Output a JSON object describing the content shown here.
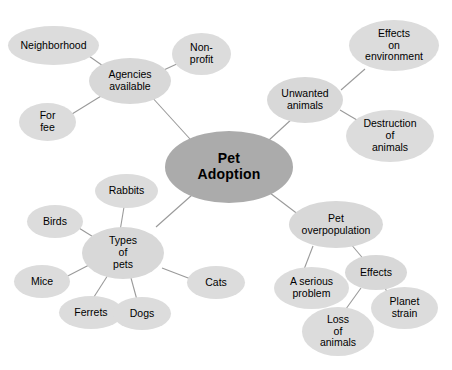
{
  "diagram": {
    "type": "mind-map",
    "title": "Pet Adoption",
    "background_color": "#ffffff",
    "central_node_color": "#ababab",
    "hub_node_color": "#d8d8d8",
    "leaf_node_color": "#dcdcdc",
    "edge_color": "#9a9a9a",
    "center": {
      "id": "pet-adoption",
      "label": "Pet\nAdoption"
    },
    "branches": [
      {
        "id": "agencies-available",
        "label": "Agencies\navailable",
        "children": [
          {
            "id": "neighborhood",
            "label": "Neighborhood"
          },
          {
            "id": "non-profit",
            "label": "Non-\nprofit"
          },
          {
            "id": "for-fee",
            "label": "For\nfee"
          }
        ]
      },
      {
        "id": "unwanted-animals",
        "label": "Unwanted\nanimals",
        "children": [
          {
            "id": "effects-on-environment",
            "label": "Effects\non\nenvironment"
          },
          {
            "id": "destruction-of-animals",
            "label": "Destruction\nof\nanimals"
          }
        ]
      },
      {
        "id": "types-of-pets",
        "label": "Types\nof\npets",
        "children": [
          {
            "id": "rabbits",
            "label": "Rabbits"
          },
          {
            "id": "birds",
            "label": "Birds"
          },
          {
            "id": "mice",
            "label": "Mice"
          },
          {
            "id": "ferrets",
            "label": "Ferrets"
          },
          {
            "id": "dogs",
            "label": "Dogs"
          },
          {
            "id": "cats",
            "label": "Cats"
          }
        ]
      },
      {
        "id": "pet-overpopulation",
        "label": "Pet\noverpopulation",
        "children": [
          {
            "id": "a-serious-problem",
            "label": "A serious\nproblem"
          },
          {
            "id": "effects",
            "label": "Effects",
            "children": [
              {
                "id": "loss-of-animals",
                "label": "Loss\nof\nanimals"
              },
              {
                "id": "planet-strain",
                "label": "Planet\nstrain"
              }
            ]
          }
        ]
      }
    ]
  }
}
